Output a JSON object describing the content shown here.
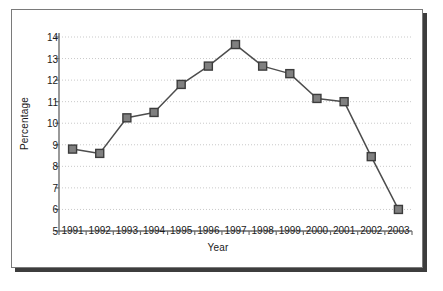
{
  "chart_data": {
    "type": "line",
    "title": "",
    "xlabel": "Year",
    "ylabel": "Percentage",
    "categories": [
      "1991",
      "1992",
      "1993",
      "1994",
      "1995",
      "1996",
      "1997",
      "1998",
      "1999",
      "2000",
      "2001",
      "2002",
      "2003"
    ],
    "values": [
      8.8,
      8.6,
      10.25,
      10.5,
      11.8,
      12.65,
      13.65,
      12.65,
      12.3,
      11.15,
      11.0,
      8.45,
      6.0
    ],
    "ylim": [
      5,
      14
    ],
    "ytick_labels": [
      "14",
      "13",
      "12",
      "11",
      "10",
      "9",
      "8",
      "7",
      "6",
      "5"
    ],
    "ytick_values": [
      14,
      13,
      12,
      11,
      10,
      9,
      8,
      7,
      6,
      5
    ],
    "grid": "horizontal-dotted",
    "legend": "none",
    "marker": "square",
    "colors": {
      "line": "#4d4d4d",
      "marker_fill": "#808080",
      "marker_edge": "#3c3c3c",
      "grid": "#c9c9c9",
      "axis": "#6e6e6e",
      "text": "#1a1a1a",
      "frame_border": "#7a7a7a",
      "frame_shadow": "#3d3d3d",
      "background": "#ffffff"
    }
  }
}
